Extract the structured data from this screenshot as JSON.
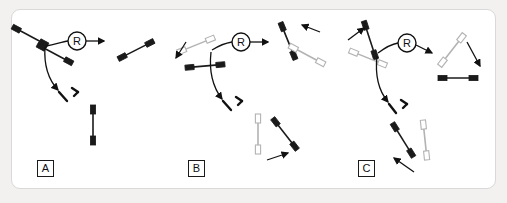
{
  "figure": {
    "background_color": "#f2f1ef",
    "card_color": "#ffffff",
    "card_border_color": "#d9d9d9",
    "chromosome_black": "#1a1a1a",
    "chromosome_gray": "#b3b3b3",
    "arrow_color": "#111111"
  },
  "panels": [
    {
      "id": "A",
      "label": "A",
      "node_label": "R",
      "inputs": [
        {
          "name": "chromosome-black-upper-left",
          "color": "#1a1a1a"
        },
        {
          "name": "chromosome-black-lower-right",
          "color": "#1a1a1a"
        }
      ],
      "outputs_top": [
        {
          "name": "chromosome-black-diagonal",
          "color": "#1a1a1a"
        }
      ],
      "outputs_bottom": [
        {
          "name": "chromosome-black-vertical",
          "color": "#1a1a1a"
        }
      ]
    },
    {
      "id": "B",
      "label": "B",
      "node_label": "R",
      "inputs": [
        {
          "name": "chromosome-gray-diagonal",
          "color": "#b3b3b3"
        },
        {
          "name": "chromosome-black-horizontal",
          "color": "#1a1a1a"
        }
      ],
      "outputs_top": [
        {
          "name": "chromosome-black-steep",
          "color": "#1a1a1a"
        },
        {
          "name": "chromosome-gray-shallow",
          "color": "#b3b3b3"
        }
      ],
      "outputs_bottom": [
        {
          "name": "chromosome-gray-vertical",
          "color": "#b3b3b3"
        },
        {
          "name": "chromosome-black-diagonal",
          "color": "#1a1a1a"
        }
      ]
    },
    {
      "id": "C",
      "label": "C",
      "node_label": "R",
      "inputs": [
        {
          "name": "chromosome-black-steep",
          "color": "#1a1a1a"
        },
        {
          "name": "chromosome-gray-diagonal",
          "color": "#b3b3b3"
        }
      ],
      "outputs_top": [
        {
          "name": "chromosome-gray-diagonal",
          "color": "#b3b3b3"
        },
        {
          "name": "chromosome-black-horizontal",
          "color": "#1a1a1a"
        }
      ],
      "outputs_bottom": [
        {
          "name": "chromosome-black-diagonal",
          "color": "#1a1a1a"
        },
        {
          "name": "chromosome-gray-vertical",
          "color": "#b3b3b3"
        }
      ]
    }
  ]
}
